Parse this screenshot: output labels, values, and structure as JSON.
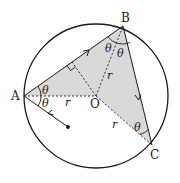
{
  "figure": {
    "points": {
      "A": {
        "label": "A",
        "x": 24,
        "y": 96
      },
      "B": {
        "label": "B",
        "x": 123,
        "y": 26
      },
      "C": {
        "label": "C",
        "x": 152,
        "y": 145
      },
      "O": {
        "label": "O",
        "x": 96,
        "y": 96
      }
    },
    "circle": {
      "cx": 96,
      "cy": 96,
      "r": 72
    },
    "source_dot": {
      "x": 68,
      "y": 127
    },
    "labels": {
      "theta": "θ",
      "radius": "r",
      "A": "A",
      "B": "B",
      "C": "C",
      "O": "O"
    },
    "colors": {
      "stroke": "#1a1a1a",
      "shade": "#d9d9d9",
      "background": "#ffffff"
    }
  }
}
